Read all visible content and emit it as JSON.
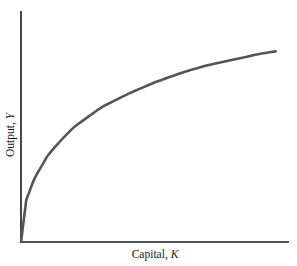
{
  "chart_data": {
    "type": "line",
    "title": "",
    "xlabel": "Capital, K",
    "ylabel": "Output, Y",
    "xlabel_parts": {
      "text": "Capital, ",
      "var": "K"
    },
    "ylabel_parts": {
      "text": "Output, ",
      "var": "Y"
    },
    "grid": false,
    "legend": null,
    "x_ticks": [],
    "y_ticks": [],
    "series": [
      {
        "name": "Production function",
        "color": "#555555",
        "description": "Concave, increasing at a diminishing rate (diminishing marginal product of capital)",
        "x": [
          0,
          0.02,
          0.05,
          0.1,
          0.15,
          0.2,
          0.3,
          0.4,
          0.5,
          0.6,
          0.7,
          0.8,
          0.9,
          1.0
        ],
        "y": [
          0,
          0.22,
          0.33,
          0.45,
          0.53,
          0.6,
          0.7,
          0.77,
          0.83,
          0.88,
          0.92,
          0.95,
          0.98,
          1.0
        ]
      }
    ],
    "xlim": [
      0,
      1
    ],
    "ylim": [
      0,
      1.2
    ]
  },
  "colors": {
    "axis": "#1a1a1a",
    "curve": "#555555",
    "background": "#ffffff"
  }
}
